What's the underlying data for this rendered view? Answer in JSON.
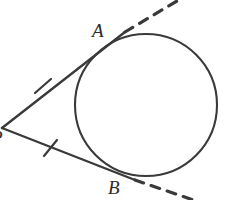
{
  "figure": {
    "kind": "geometry-diagram",
    "background_color": "#ffffff",
    "stroke_color": "#3a3a3a",
    "label_color": "#2b2b2b",
    "width": 234,
    "height": 200
  },
  "labels": {
    "point_a": "A",
    "point_b": "B",
    "point_p": "P"
  },
  "chart_data": {
    "type": "scatter",
    "xlabel": "",
    "ylabel": "",
    "xlim": [
      0,
      234
    ],
    "ylim": [
      200,
      0
    ],
    "grid": false,
    "legend": "none",
    "annotations": [
      {
        "text": "A",
        "x": 100,
        "y": 31,
        "note": "label for upper tangency point"
      },
      {
        "text": "B",
        "x": 116,
        "y": 189,
        "note": "label for lower tangency point"
      },
      {
        "text": "P",
        "x": -2,
        "y": 138,
        "note": "label for external vertex, clipped at left edge"
      }
    ],
    "points": [
      {
        "name": "P",
        "x": 2,
        "y": 128,
        "role": "external-vertex"
      },
      {
        "name": "A",
        "x": 125,
        "y": 32,
        "role": "tangency-point-upper"
      },
      {
        "name": "B",
        "x": 135,
        "y": 180,
        "role": "tangency-point-lower"
      },
      {
        "name": "tick_upper",
        "x": 43,
        "y": 86,
        "role": "congruence-tick-center"
      },
      {
        "name": "tick_lower",
        "x": 50,
        "y": 148,
        "role": "congruence-tick-center"
      }
    ],
    "circle": {
      "cx": 146,
      "cy": 105,
      "r": 71,
      "filled": false,
      "stroke_width": 2.1
    },
    "segments": [
      {
        "name": "PA",
        "from": "P",
        "to": "A",
        "x1": 2,
        "y1": 128,
        "x2": 125,
        "y2": 32,
        "style": "solid",
        "ticks": 1
      },
      {
        "name": "PB",
        "from": "P",
        "to": "B",
        "x1": 2,
        "y1": 128,
        "x2": 135,
        "y2": 180,
        "style": "solid",
        "ticks": 1
      },
      {
        "name": "A-extension",
        "from": "A",
        "to": "ray-end",
        "x1": 125,
        "y1": 32,
        "x2": 182,
        "y2": -2,
        "style": "dashed",
        "ticks": 0
      },
      {
        "name": "B-extension",
        "from": "B",
        "to": "ray-end",
        "x1": 135,
        "y1": 180,
        "x2": 199,
        "y2": 202,
        "style": "dashed",
        "ticks": 0
      }
    ],
    "ticks": [
      {
        "name": "tick_upper",
        "x1": 35,
        "y1": 93,
        "x2": 51,
        "y2": 79
      },
      {
        "name": "tick_lower",
        "x1": 44,
        "y1": 156,
        "x2": 57,
        "y2": 140
      }
    ]
  }
}
